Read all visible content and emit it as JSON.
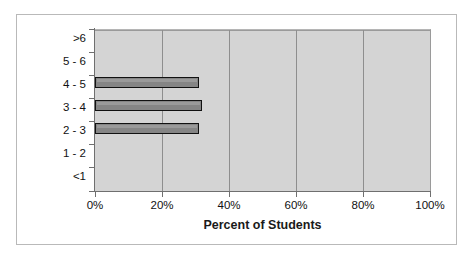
{
  "chart_data": {
    "type": "bar",
    "orientation": "horizontal",
    "title": "",
    "xlabel": "Percent of Students",
    "ylabel": "Time to Perform (hrs)",
    "categories": [
      "<1",
      "1 - 2",
      "2 - 3",
      "3 - 4",
      "4 - 5",
      "5 - 6",
      ">6"
    ],
    "values": [
      0,
      0,
      31,
      32,
      31,
      0,
      0
    ],
    "xlim": [
      0,
      100
    ],
    "xticks": [
      0,
      20,
      40,
      60,
      80,
      100
    ],
    "xtick_labels": [
      "0%",
      "20%",
      "40%",
      "60%",
      "80%",
      "100%"
    ],
    "grid": "vertical",
    "legend": "none",
    "colors": {
      "bar_fill": "#858585",
      "bar_border": "#111111",
      "plot_background": "#d4d4d4",
      "gridline": "#8e8e8e",
      "axis": "#6f6f6f",
      "frame_border": "#b9b9b9",
      "text": "#111111"
    }
  }
}
